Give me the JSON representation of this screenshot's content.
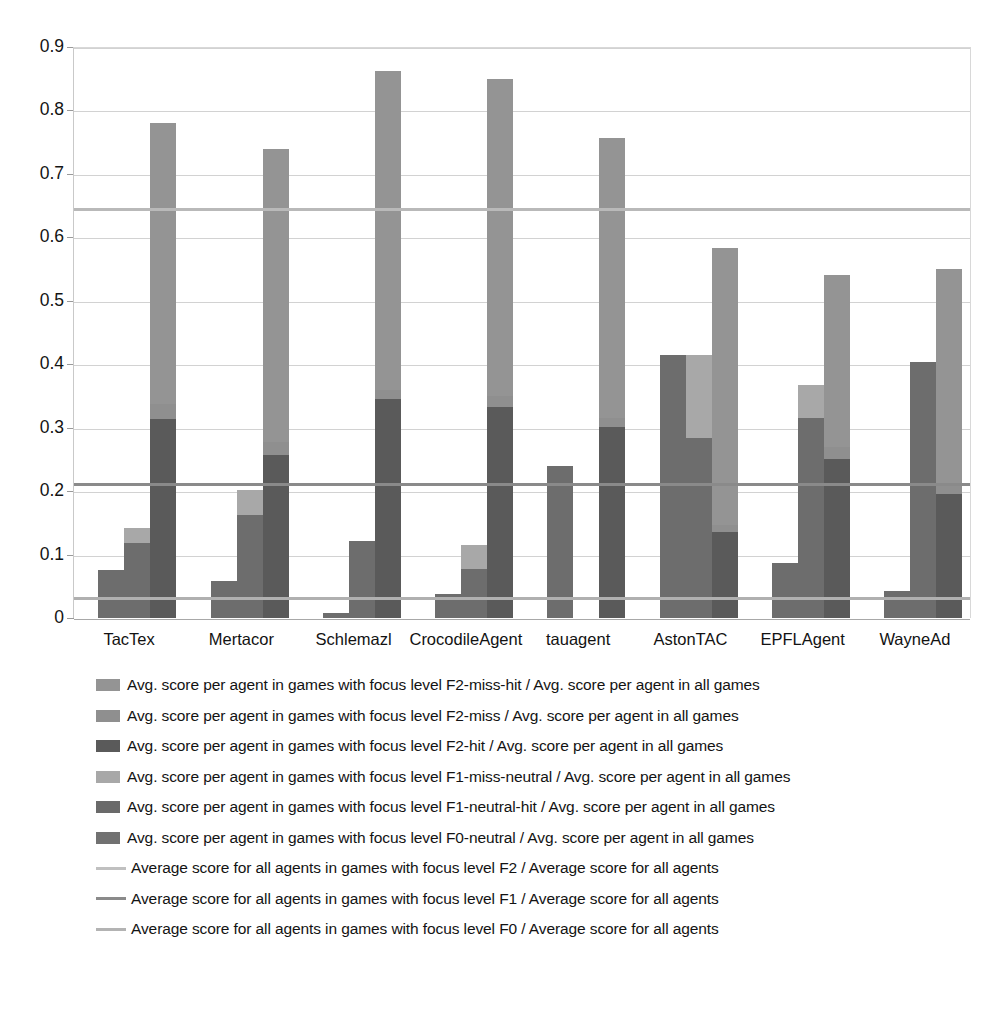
{
  "chart_data": {
    "type": "bar",
    "subtype": "stacked-grouped-bar",
    "title": "",
    "xlabel": "",
    "ylabel": "",
    "ylim": [
      0,
      0.9
    ],
    "ytick_labels": [
      "0",
      "0.1",
      "0.2",
      "0.3",
      "0.4",
      "0.5",
      "0.6",
      "0.7",
      "0.8",
      "0.9"
    ],
    "ytick_values": [
      0,
      0.1,
      0.2,
      0.3,
      0.4,
      0.5,
      0.6,
      0.7,
      0.8,
      0.9
    ],
    "grid": "horizontal",
    "legend_position": "below",
    "categories": [
      "TacTex",
      "Mertacor",
      "Schlemazl",
      "CrocodileAgent",
      "tauagent",
      "AstonTAC",
      "EPFLAgent",
      "WayneAd"
    ],
    "series": [
      {
        "name": "F0-neutral",
        "label": "Avg. score per agent in games with focus level F0-neutral / Avg. score per agent in all games",
        "color": "#6d6d6d",
        "stack": "bar1",
        "values": [
          0.075,
          0.058,
          0.008,
          0.038,
          0.24,
          0.415,
          0.086,
          0.043
        ]
      },
      {
        "name": "F1-neutral-hit",
        "label": "Avg. score per agent in games with focus level F1-neutral-hit / Avg. score per agent in all games",
        "color": "#6d6d6d",
        "stack": "bar2",
        "values": [
          0.118,
          0.162,
          0.122,
          0.078,
          0.0,
          0.283,
          0.315,
          0.403
        ]
      },
      {
        "name": "F1-miss-neutral",
        "label": "Avg. score per agent in games with focus level F1-miss-neutral / Avg. score per agent in all games",
        "color": "#a8a8a8",
        "stack": "bar2",
        "values": [
          0.024,
          0.04,
          0.0,
          0.037,
          0.0,
          0.131,
          0.053,
          0.0
        ]
      },
      {
        "name": "F2-hit",
        "label": "Avg. score per agent in games with focus level F2-hit / Avg. score per agent in all games",
        "color": "#5a5a5a",
        "stack": "bar3",
        "values": [
          0.313,
          0.257,
          0.345,
          0.332,
          0.301,
          0.135,
          0.251,
          0.196
        ]
      },
      {
        "name": "F2-miss",
        "label": "Avg. score per agent in games with focus level F2-miss / Avg. score per agent in all games",
        "color": "#8f8f8f",
        "stack": "bar3",
        "values": [
          0.025,
          0.02,
          0.015,
          0.018,
          0.014,
          0.012,
          0.018,
          0.015
        ]
      },
      {
        "name": "F2-miss-hit",
        "label": "Avg. score per agent in games with focus level F2-miss-hit / Avg. score per agent in all games",
        "color": "#949494",
        "stack": "bar3",
        "values": [
          0.442,
          0.463,
          0.502,
          0.5,
          0.441,
          0.437,
          0.271,
          0.339
        ]
      }
    ],
    "stacked_totals": {
      "bar1": [
        0.075,
        0.058,
        0.008,
        0.038,
        0.24,
        0.415,
        0.086,
        0.043
      ],
      "bar2": [
        0.142,
        0.202,
        0.122,
        0.115,
        null,
        0.414,
        0.368,
        0.403
      ],
      "bar3": [
        0.78,
        0.74,
        0.862,
        0.85,
        0.756,
        0.584,
        0.54,
        0.55
      ]
    },
    "reference_lines": [
      {
        "name": "F2",
        "label": "Average score for all agents in games with focus level F2 / Average score for all agents",
        "value": 0.648,
        "color": "#b9b9b9"
      },
      {
        "name": "F1",
        "label": "Average score for all agents in games with focus level F1 / Average score for all agents",
        "value": 0.215,
        "color": "#8a8a8a"
      },
      {
        "name": "F0",
        "label": "Average score for all agents in games with focus level F0 / Average score for all agents",
        "value": 0.035,
        "color": "#b0b0b0"
      }
    ]
  },
  "legend": {
    "entries": [
      {
        "kind": "swatch",
        "color": "#949494",
        "text": "Avg. score per agent in games with focus level F2-miss-hit / Avg. score per agent in all games"
      },
      {
        "kind": "swatch",
        "color": "#8f8f8f",
        "text": "Avg. score per agent in games with focus level F2-miss / Avg. score per agent in all games"
      },
      {
        "kind": "swatch",
        "color": "#5a5a5a",
        "text": "Avg. score per agent in games with focus level F2-hit / Avg. score per agent in all games"
      },
      {
        "kind": "swatch",
        "color": "#a8a8a8",
        "text": "Avg. score per agent in games with focus level F1-miss-neutral / Avg. score per agent in all games"
      },
      {
        "kind": "swatch",
        "color": "#6a6a6a",
        "text": "Avg. score per agent in games with focus level F1-neutral-hit / Avg. score per agent in all games"
      },
      {
        "kind": "swatch",
        "color": "#717171",
        "text": "Avg. score per agent in games with focus level F0-neutral / Avg. score per agent in all games"
      },
      {
        "kind": "line",
        "color": "#c0c0c0",
        "text": "Average score for all agents in games with focus level F2 / Average score for all agents"
      },
      {
        "kind": "line",
        "color": "#8a8a8a",
        "text": "Average score for all agents in games with focus level F1 / Average score for all agents"
      },
      {
        "kind": "line",
        "color": "#b3b3b3",
        "text": "Average score for all agents in games with focus level F0 / Average score for all agents"
      }
    ]
  }
}
